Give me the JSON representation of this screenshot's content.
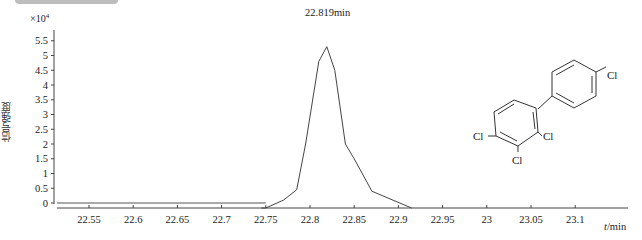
{
  "chart_data": {
    "type": "line",
    "title": "",
    "xlabel": "t/min",
    "ylabel": "信号强度",
    "y_multiplier": "×10^4",
    "xlim": [
      22.51,
      23.16
    ],
    "ylim": [
      0,
      5.7
    ],
    "x_ticks": [
      "22.55",
      "22.6",
      "22.65",
      "22.7",
      "22.75",
      "22.8",
      "22.85",
      "22.9",
      "22.95",
      "23",
      "23.05",
      "23.1"
    ],
    "y_ticks": [
      "0",
      "0.5",
      "1",
      "1.5",
      "2",
      "2.5",
      "3",
      "3.5",
      "4",
      "4.5",
      "5",
      "5.5"
    ],
    "grid": false,
    "legend": null,
    "annotations": [
      {
        "text": "22.819min",
        "x": 22.819,
        "y": 5.3
      }
    ],
    "series": [
      {
        "name": "chromatogram",
        "x": [
          22.52,
          22.75,
          22.77,
          22.785,
          22.795,
          22.81,
          22.819,
          22.828,
          22.84,
          22.85,
          22.87,
          22.895,
          22.915
        ],
        "values": [
          0,
          0,
          0.1,
          0.45,
          2.0,
          4.8,
          5.3,
          4.5,
          2.0,
          1.5,
          0.4,
          0.08,
          0
        ]
      }
    ]
  },
  "labels": {
    "multiplier_base": "×10",
    "multiplier_exp": "4",
    "ylabel": "信号强度",
    "xunit_var": "t",
    "xunit_rest": "/min",
    "peak": "22.819min"
  },
  "molecule": {
    "name": "2,3,4,4'-tetrachlorobiphenyl",
    "substituent": "Cl"
  }
}
